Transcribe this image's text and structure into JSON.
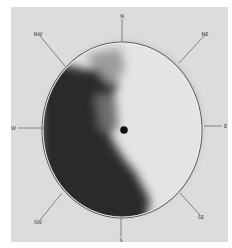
{
  "image": {
    "subject": "circular plate with compass direction markers",
    "background_color": "#dcdcdc",
    "plate_light_color": "#e6e6e6",
    "plate_dark_color": "#2a2a2a"
  },
  "compass": {
    "n": "N",
    "ne": "NE",
    "e": "E",
    "se": "SE",
    "s": "S",
    "sw": "SW",
    "w": "W",
    "nw": "NW"
  }
}
